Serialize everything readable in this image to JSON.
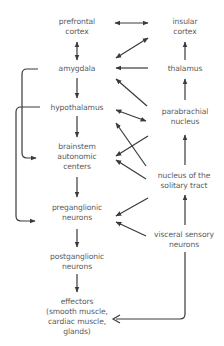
{
  "title": "",
  "nodes": {
    "prefrontal_cortex": "prefrontal\ncortex",
    "amygdala": "amygdala",
    "hypothalamus": "hypothalamus",
    "brainstem_autonomic_centers": "brainstem\nautonomic\ncenters",
    "preganglionic_neurons": "preganglionic\nneurons",
    "postganglionic_neurons": "postganglionic\nneurons",
    "effectors": "effectors\n(smooth muscle,\ncardiac muscle,\nglands)",
    "insular_cortex": "insular\ncortex",
    "thalamus": "thalamus",
    "parabrachial_nucleus": "parabrachial\nnucleus",
    "nucleus_solitary_tract": "nucleus of the\nsolitary tract",
    "visceral_sensory_neurons": "visceral sensory\nneurons"
  },
  "edges": [
    {
      "from": "prefrontal_cortex",
      "to": "amygdala",
      "direction": "bidirectional"
    },
    {
      "from": "amygdala",
      "to": "hypothalamus",
      "direction": "forward"
    },
    {
      "from": "hypothalamus",
      "to": "brainstem_autonomic_centers",
      "direction": "forward"
    },
    {
      "from": "brainstem_autonomic_centers",
      "to": "preganglionic_neurons",
      "direction": "forward"
    },
    {
      "from": "preganglionic_neurons",
      "to": "postganglionic_neurons",
      "direction": "forward"
    },
    {
      "from": "postganglionic_neurons",
      "to": "effectors",
      "direction": "forward"
    },
    {
      "from": "prefrontal_cortex",
      "to": "insular_cortex",
      "direction": "bidirectional"
    },
    {
      "from": "amygdala",
      "to": "insular_cortex",
      "direction": "bidirectional"
    },
    {
      "from": "thalamus",
      "to": "amygdala",
      "direction": "forward"
    },
    {
      "from": "parabrachial_nucleus",
      "to": "amygdala",
      "direction": "forward"
    },
    {
      "from": "hypothalamus",
      "to": "parabrachial_nucleus",
      "direction": "bidirectional"
    },
    {
      "from": "nucleus_solitary_tract",
      "to": "hypothalamus",
      "direction": "forward"
    },
    {
      "from": "parabrachial_nucleus",
      "to": "brainstem_autonomic_centers",
      "direction": "forward"
    },
    {
      "from": "nucleus_solitary_tract",
      "to": "brainstem_autonomic_centers",
      "direction": "forward"
    },
    {
      "from": "nucleus_solitary_tract",
      "to": "preganglionic_neurons",
      "direction": "forward"
    },
    {
      "from": "visceral_sensory_neurons",
      "to": "preganglionic_neurons",
      "direction": "forward"
    },
    {
      "from": "thalamus",
      "to": "insular_cortex",
      "direction": "forward"
    },
    {
      "from": "parabrachial_nucleus",
      "to": "thalamus",
      "direction": "forward"
    },
    {
      "from": "nucleus_solitary_tract",
      "to": "parabrachial_nucleus",
      "direction": "forward"
    },
    {
      "from": "visceral_sensory_neurons",
      "to": "nucleus_solitary_tract",
      "direction": "forward"
    },
    {
      "from": "visceral_sensory_neurons",
      "to": "effectors",
      "direction": "forward"
    },
    {
      "from": "amygdala",
      "to": "brainstem_autonomic_centers",
      "direction": "forward"
    },
    {
      "from": "hypothalamus",
      "to": "preganglionic_neurons",
      "direction": "forward"
    }
  ]
}
